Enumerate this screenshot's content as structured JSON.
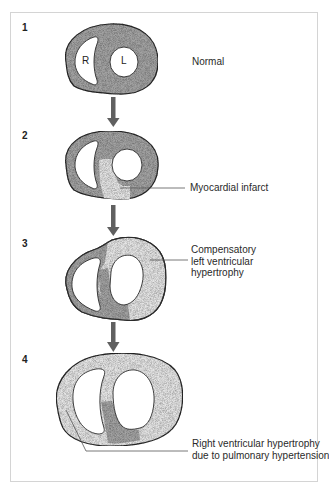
{
  "diagram": {
    "colors": {
      "normal_myocardium": "#a3a3a3",
      "infarct_hypertrophy": "#e4e4e4",
      "cavity": "#ffffff",
      "outline": "#2b2b2b",
      "arrow": "#606060",
      "leader_line": "#555555",
      "frame": "#d4d4d4"
    },
    "stages": [
      {
        "number": "1",
        "label": "Normal",
        "chambers": {
          "right": "R",
          "left": "L"
        }
      },
      {
        "number": "2",
        "label": "Myocardial infarct"
      },
      {
        "number": "3",
        "label": "Compensatory\nleft ventricular\nhypertrophy"
      },
      {
        "number": "4",
        "label": "Right ventricular hypertrophy\ndue to pulmonary hypertension"
      }
    ]
  }
}
